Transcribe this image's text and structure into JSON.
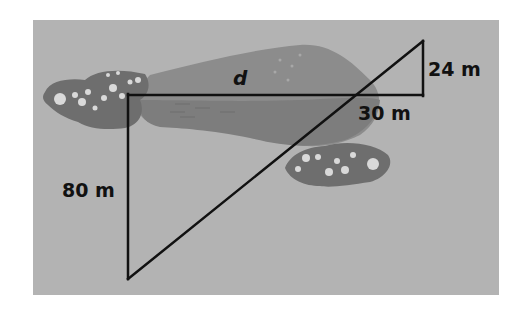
{
  "diagram": {
    "type": "similar-triangles-pond-distance",
    "labels": {
      "d": "d",
      "left_leg": "80 m",
      "small_base": "30 m",
      "small_height": "24 m"
    },
    "colors": {
      "background_panel": "#b3b3b3",
      "pond": "#8c8c8c",
      "pond_dark": "#7a7a7a",
      "flower_bush": "#6e6e6e",
      "flower": "#d9d9d9",
      "lines": "#111111"
    }
  }
}
